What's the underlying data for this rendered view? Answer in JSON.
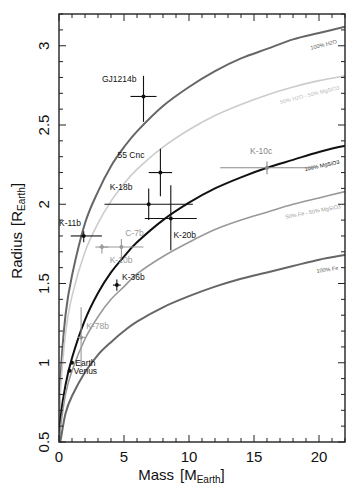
{
  "chart_data": {
    "type": "scatter",
    "title": "",
    "xlabel": "Mass [M_Earth]",
    "xlabel_main": "Mass",
    "xlabel_unit_base": "M",
    "xlabel_unit_sub": "Earth",
    "ylabel": "Radius [R_Earth]",
    "ylabel_main": "Radius",
    "ylabel_unit_base": "R",
    "ylabel_unit_sub": "Earth",
    "xlim": [
      0,
      22
    ],
    "ylim": [
      0.5,
      3.2
    ],
    "xticks": [
      0,
      5,
      10,
      15,
      20
    ],
    "xtick_labels": [
      "0",
      "5",
      "10",
      "15",
      "20"
    ],
    "yticks": [
      0.5,
      1,
      1.5,
      2,
      2.5,
      3
    ],
    "ytick_labels": [
      "0.5",
      "1",
      "1.5",
      "2",
      "2.5",
      "3"
    ],
    "x_minor_step": 1,
    "y_minor_step": 0.1,
    "grid": false,
    "legend": "none (curves labeled inline)",
    "curves": [
      {
        "name": "100% H2O",
        "label": "100% H2O",
        "color": "#666666",
        "width": 2.0,
        "points": [
          [
            0.1,
            0.88
          ],
          [
            0.5,
            1.3
          ],
          [
            1,
            1.55
          ],
          [
            2,
            1.88
          ],
          [
            3,
            2.08
          ],
          [
            4,
            2.24
          ],
          [
            5,
            2.36
          ],
          [
            6,
            2.46
          ],
          [
            8,
            2.62
          ],
          [
            10,
            2.74
          ],
          [
            12,
            2.84
          ],
          [
            14,
            2.92
          ],
          [
            16,
            2.98
          ],
          [
            18,
            3.04
          ],
          [
            20,
            3.08
          ],
          [
            22,
            3.12
          ]
        ]
      },
      {
        "name": "50% H2O - 50% MgSiO3",
        "label": "50% H2O - 50% MgSiO3",
        "color": "#cccccc",
        "width": 1.6,
        "points": [
          [
            0.1,
            0.8
          ],
          [
            0.5,
            1.18
          ],
          [
            1,
            1.42
          ],
          [
            2,
            1.7
          ],
          [
            3,
            1.88
          ],
          [
            4,
            2.02
          ],
          [
            5,
            2.13
          ],
          [
            6,
            2.22
          ],
          [
            8,
            2.36
          ],
          [
            10,
            2.47
          ],
          [
            12,
            2.56
          ],
          [
            14,
            2.63
          ],
          [
            16,
            2.69
          ],
          [
            18,
            2.74
          ],
          [
            20,
            2.78
          ],
          [
            22,
            2.81
          ]
        ]
      },
      {
        "name": "100% MgSiO3",
        "label": "100% MgSiO3",
        "color": "#111111",
        "width": 2.0,
        "points": [
          [
            0.1,
            0.64
          ],
          [
            0.5,
            0.86
          ],
          [
            1,
            1.03
          ],
          [
            2,
            1.27
          ],
          [
            3,
            1.44
          ],
          [
            4,
            1.57
          ],
          [
            5,
            1.67
          ],
          [
            6,
            1.76
          ],
          [
            8,
            1.9
          ],
          [
            10,
            2.01
          ],
          [
            12,
            2.1
          ],
          [
            14,
            2.17
          ],
          [
            16,
            2.23
          ],
          [
            18,
            2.28
          ],
          [
            20,
            2.33
          ],
          [
            22,
            2.37
          ]
        ]
      },
      {
        "name": "50% Fe - 50% MgSiO3",
        "label": "50% Fe - 50% MgSiO3",
        "color": "#999999",
        "width": 1.6,
        "points": [
          [
            0.1,
            0.58
          ],
          [
            0.5,
            0.8
          ],
          [
            1,
            0.95
          ],
          [
            2,
            1.15
          ],
          [
            3,
            1.29
          ],
          [
            4,
            1.4
          ],
          [
            5,
            1.48
          ],
          [
            6,
            1.56
          ],
          [
            8,
            1.67
          ],
          [
            10,
            1.76
          ],
          [
            12,
            1.84
          ],
          [
            14,
            1.9
          ],
          [
            16,
            1.95
          ],
          [
            18,
            2.0
          ],
          [
            20,
            2.04
          ],
          [
            22,
            2.08
          ]
        ]
      },
      {
        "name": "100% Fe",
        "label": "100% Fe",
        "color": "#666666",
        "width": 2.0,
        "points": [
          [
            0.1,
            0.5
          ],
          [
            0.5,
            0.68
          ],
          [
            1,
            0.79
          ],
          [
            2,
            0.94
          ],
          [
            3,
            1.05
          ],
          [
            4,
            1.13
          ],
          [
            5,
            1.2
          ],
          [
            6,
            1.26
          ],
          [
            8,
            1.35
          ],
          [
            10,
            1.42
          ],
          [
            12,
            1.48
          ],
          [
            14,
            1.53
          ],
          [
            16,
            1.57
          ],
          [
            18,
            1.61
          ],
          [
            20,
            1.65
          ],
          [
            22,
            1.68
          ]
        ]
      }
    ],
    "curve_labels": [
      {
        "text": "100% H2O",
        "x": 21.4,
        "y": 3.06,
        "angle": -14,
        "color": "#555555"
      },
      {
        "text": "50% H2O - 50% MgSiO3",
        "x": 21.6,
        "y": 2.77,
        "angle": -14,
        "color": "#bbbbbb"
      },
      {
        "text": "100% MgSiO3",
        "x": 21.6,
        "y": 2.3,
        "angle": -12,
        "color": "#111111"
      },
      {
        "text": "50% Fe - 50% MgSiO3",
        "x": 21.7,
        "y": 2.02,
        "angle": -11,
        "color": "#999999"
      },
      {
        "text": "100% Fe",
        "x": 21.5,
        "y": 1.63,
        "angle": -8,
        "color": "#555555"
      }
    ],
    "points": [
      {
        "name": "GJ1214b",
        "mass": 6.5,
        "radius": 2.68,
        "mass_err": [
          1.0,
          1.0
        ],
        "radius_err": [
          0.16,
          0.13
        ],
        "color": "#111111",
        "label_dx": -3.2,
        "label_dy": 0.09
      },
      {
        "name": "55 Cnc",
        "mass": 7.8,
        "radius": 2.2,
        "mass_err": [
          0.9,
          0.9
        ],
        "radius_err": [
          0.15,
          0.15
        ],
        "color": "#111111",
        "label_dx": -3.3,
        "label_dy": 0.09
      },
      {
        "name": "K-18b",
        "mass": 6.9,
        "radius": 2.0,
        "mass_err": [
          3.4,
          3.4
        ],
        "radius_err": [
          0.1,
          0.1
        ],
        "color": "#111111",
        "label_dx": -3.0,
        "label_dy": 0.09
      },
      {
        "name": "K-20b",
        "mass": 8.6,
        "radius": 1.91,
        "mass_err": [
          2.0,
          2.0
        ],
        "radius_err": [
          0.2,
          0.21
        ],
        "color": "#111111",
        "label_dx": 0.2,
        "label_dy": -0.12
      },
      {
        "name": "K-10c",
        "mass": 16.0,
        "radius": 2.23,
        "mass_err": [
          3.6,
          3.6
        ],
        "radius_err": [
          0.04,
          0.04
        ],
        "color": "#888888",
        "label_dx": -1.3,
        "label_dy": 0.09
      },
      {
        "name": "K-11b",
        "mass": 1.9,
        "radius": 1.8,
        "mass_err": [
          1.0,
          1.4
        ],
        "radius_err": [
          0.04,
          0.03
        ],
        "color": "#111111",
        "label_dx": -1.9,
        "label_dy": 0.06
      },
      {
        "name": "C-7b",
        "mass": 4.8,
        "radius": 1.73,
        "mass_err": [
          1.7,
          1.7
        ],
        "radius_err": [
          0.07,
          0.05
        ],
        "color": "#999999",
        "label_dx": 0.3,
        "label_dy": 0.07
      },
      {
        "name": "K-10b",
        "mass": 3.3,
        "radius": 1.73,
        "mass_err": [
          0.5,
          0.5
        ],
        "radius_err": [
          0.04,
          0.02
        ],
        "color": "#999999",
        "label_dx": 0.6,
        "label_dy": -0.1
      },
      {
        "name": "K-36b",
        "mass": 4.45,
        "radius": 1.49,
        "mass_err": [
          0.3,
          0.3
        ],
        "radius_err": [
          0.035,
          0.035
        ],
        "color": "#111111",
        "label_dx": 0.4,
        "label_dy": 0.03
      },
      {
        "name": "K-78b",
        "mass": 1.7,
        "radius": 1.16,
        "mass_err": [
          0.3,
          0.3
        ],
        "radius_err": [
          0.19,
          0.19
        ],
        "color": "#999999",
        "label_dx": 0.4,
        "label_dy": 0.05
      },
      {
        "name": "Earth",
        "mass": 1.0,
        "radius": 1.0,
        "mass_err": [
          0,
          0
        ],
        "radius_err": [
          0,
          0
        ],
        "color": "#111111",
        "label_dx": 0.25,
        "label_dy": -0.02
      },
      {
        "name": "Venus",
        "mass": 0.815,
        "radius": 0.95,
        "mass_err": [
          0,
          0
        ],
        "radius_err": [
          0,
          0
        ],
        "color": "#111111",
        "label_dx": 0.3,
        "label_dy": -0.02
      }
    ]
  },
  "layout": {
    "plot_left": 59,
    "plot_right": 345,
    "plot_top": 14,
    "plot_bottom": 442,
    "x_per_unit": 13.0,
    "y_per_unit": 158.5
  }
}
